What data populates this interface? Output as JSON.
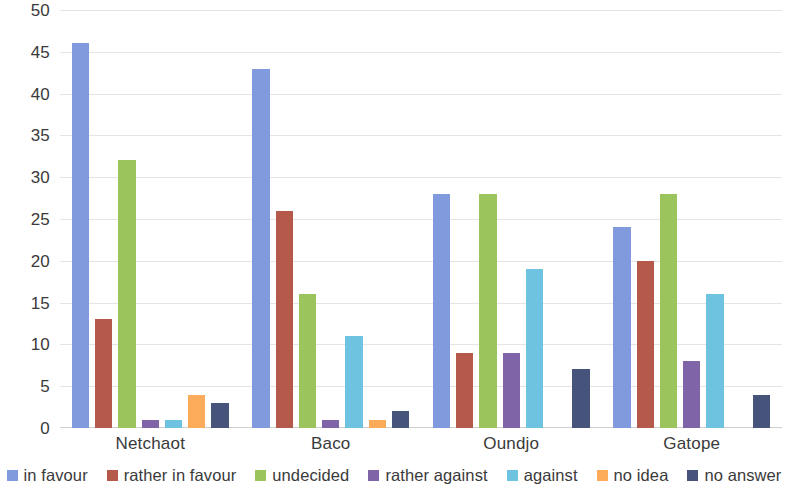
{
  "chart_data": {
    "type": "bar",
    "title": "",
    "subtitle": "",
    "xlabel": "",
    "ylabel": "",
    "categories": [
      "Netchaot",
      "Baco",
      "Oundjo",
      "Gatope"
    ],
    "series": [
      {
        "name": "in favour",
        "color": "#8199dd",
        "values": [
          46,
          43,
          28,
          24
        ]
      },
      {
        "name": "rather in favour",
        "color": "#b55a4a",
        "values": [
          13,
          26,
          9,
          20
        ]
      },
      {
        "name": "undecided",
        "color": "#9cc45c",
        "values": [
          32,
          16,
          28,
          28
        ]
      },
      {
        "name": "rather against",
        "color": "#8064a8",
        "values": [
          1,
          1,
          9,
          8
        ]
      },
      {
        "name": "against",
        "color": "#6dc3e0",
        "values": [
          1,
          11,
          19,
          16
        ]
      },
      {
        "name": "no idea",
        "color": "#fbab5a",
        "values": [
          4,
          1,
          0,
          0
        ]
      },
      {
        "name": "no answer",
        "color": "#46537a",
        "values": [
          3,
          2,
          7,
          4
        ]
      }
    ],
    "ylim": [
      0,
      50
    ],
    "ytick_step": 5,
    "yticks": [
      50,
      45,
      40,
      35,
      30,
      25,
      20,
      15,
      10,
      5,
      0
    ],
    "ytick_labels": [
      "50",
      "45",
      "40",
      "35",
      "30",
      "25",
      "20",
      "15",
      "10",
      "5",
      "0"
    ],
    "grid": true,
    "grid_axis": "y",
    "legend_position": "bottom",
    "legend_entries": [
      "in favour",
      "rather in favour",
      "undecided",
      "rather against",
      "against",
      "no idea",
      "no answer"
    ],
    "background_color": "#ffffff",
    "gridline_color": "#e4e4e4",
    "text_color": "#3a3a3a"
  }
}
